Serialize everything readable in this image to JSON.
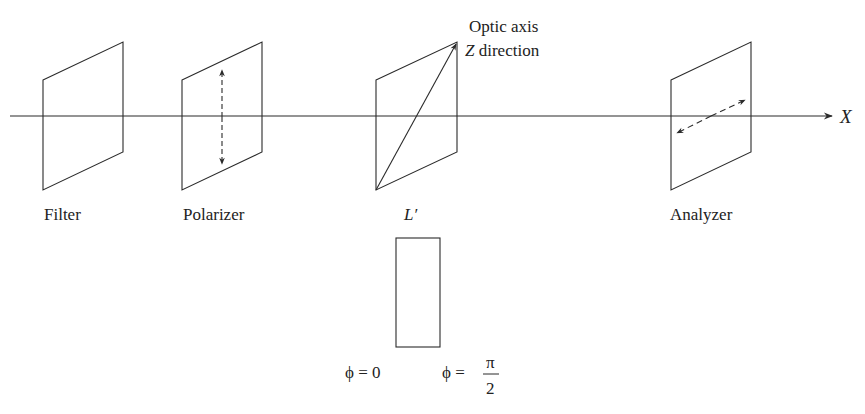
{
  "diagram": {
    "axis": {
      "label": "X"
    },
    "components": [
      {
        "id": "filter",
        "label": "Filter"
      },
      {
        "id": "polarizer",
        "label": "Polarizer",
        "polarization": "vertical"
      },
      {
        "id": "retarder",
        "label": "L′",
        "annotation": [
          "Optic axis",
          "Z direction"
        ]
      },
      {
        "id": "analyzer",
        "label": "Analyzer",
        "polarization": "horizontal-transverse"
      }
    ],
    "phase_box": {
      "left_label": "ϕ = 0",
      "right_label_prefix": "ϕ =",
      "right_label_num": "π",
      "right_label_den": "2"
    },
    "colors": {
      "line": "#2a2a2a",
      "text": "#222222",
      "background": "#ffffff"
    }
  }
}
